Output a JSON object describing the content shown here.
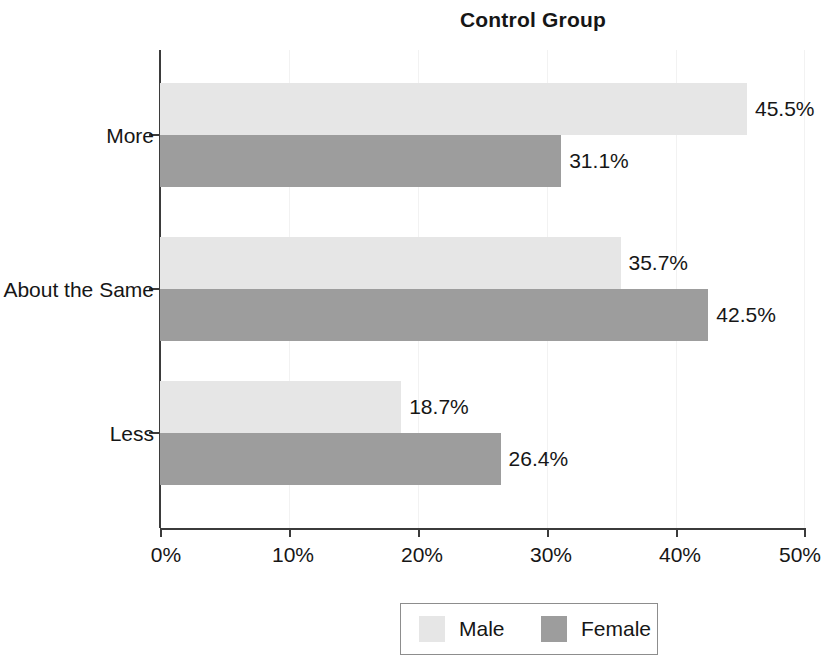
{
  "chart_data": {
    "type": "bar",
    "orientation": "horizontal",
    "title": "Control Group",
    "xlabel": "",
    "ylabel": "",
    "categories": [
      "More",
      "About the Same",
      "Less"
    ],
    "series": [
      {
        "name": "Male",
        "color": "#e6e6e6",
        "values": [
          45.5,
          35.7,
          18.7
        ],
        "labels": [
          "45.5%",
          "35.7%",
          "18.7%"
        ]
      },
      {
        "name": "Female",
        "color": "#9d9d9d",
        "values": [
          31.1,
          42.5,
          26.4
        ],
        "labels": [
          "31.1%",
          "42.5%",
          "26.4%"
        ]
      }
    ],
    "xlim": [
      0,
      50
    ],
    "xticks": [
      0,
      10,
      20,
      30,
      40,
      50
    ],
    "xtick_labels": [
      "0%",
      "10%",
      "20%",
      "30%",
      "40%",
      "50%"
    ],
    "grid": "faint-vertical",
    "legend": {
      "position": "bottom-center",
      "entries": [
        {
          "label": "Male",
          "color": "#e6e6e6"
        },
        {
          "label": "Female",
          "color": "#9d9d9d"
        }
      ]
    }
  }
}
